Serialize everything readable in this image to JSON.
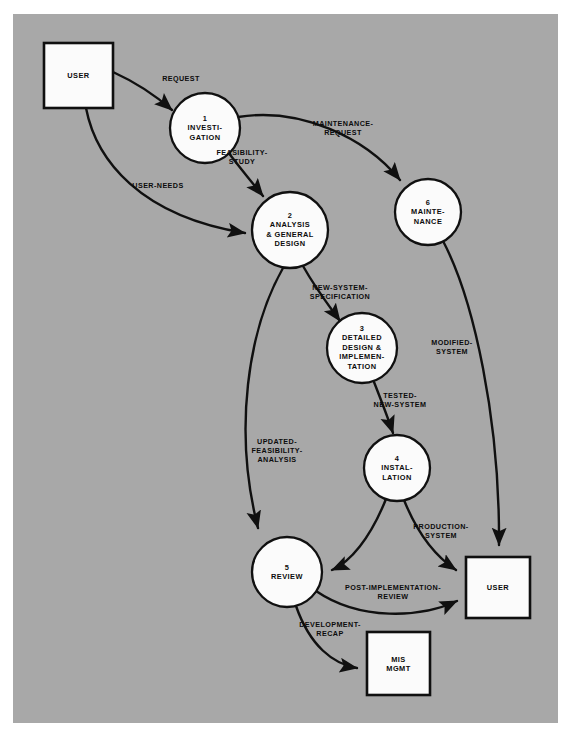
{
  "diagram": {
    "type": "data-flow-diagram",
    "background_color": "#a8a8a8",
    "page_color": "#ffffff",
    "line_color": "#101010",
    "node_fill": "#fbfbfb",
    "nodes": [
      {
        "id": "user-left",
        "shape": "box",
        "label": "USER",
        "x": 44,
        "y": 43,
        "w": 69,
        "h": 65
      },
      {
        "id": "process-1",
        "shape": "circle",
        "number": "1",
        "label": "1\nINVESTI-\nGATION",
        "cx": 205,
        "cy": 128,
        "r": 35
      },
      {
        "id": "process-2",
        "shape": "circle",
        "number": "2",
        "label": "2\nANALYSIS\n& GENERAL\nDESIGN",
        "cx": 290,
        "cy": 230,
        "r": 38
      },
      {
        "id": "process-6",
        "shape": "circle",
        "number": "6",
        "label": "6\nMAINTE-\nNANCE",
        "cx": 428,
        "cy": 212,
        "r": 33
      },
      {
        "id": "process-3",
        "shape": "circle",
        "number": "3",
        "label": "3\nDETAILED\nDESIGN &\nIMPLEMEN-\nTATION",
        "cx": 362,
        "cy": 348,
        "r": 35
      },
      {
        "id": "process-4",
        "shape": "circle",
        "number": "4",
        "label": "4\nINSTAL-\nLATION",
        "cx": 397,
        "cy": 468,
        "r": 33
      },
      {
        "id": "process-5",
        "shape": "circle",
        "number": "5",
        "label": "5\nREVIEW",
        "cx": 287,
        "cy": 572,
        "r": 35
      },
      {
        "id": "user-right",
        "shape": "box",
        "label": "USER",
        "x": 466,
        "y": 557,
        "w": 64,
        "h": 61
      },
      {
        "id": "mis-mgmt",
        "shape": "box",
        "label": "MIS\nMGMT",
        "x": 367,
        "y": 632,
        "w": 63,
        "h": 63
      }
    ],
    "flows": [
      {
        "id": "flow-request",
        "label": "REQUEST",
        "from": "user-left",
        "to": "process-1",
        "label_x": 181,
        "label_y": 79
      },
      {
        "id": "flow-user-needs",
        "label": "USER-NEEDS",
        "from": "user-left",
        "to": "process-2",
        "label_x": 158,
        "label_y": 186
      },
      {
        "id": "flow-feasibility-study",
        "label": "FEASIBILITY-\nSTUDY",
        "from": "process-1",
        "to": "process-2",
        "label_x": 242,
        "label_y": 157
      },
      {
        "id": "flow-maintenance-request",
        "label": "MAINTENANCE-\nREQUEST",
        "from": "process-1",
        "to": "process-6",
        "label_x": 343,
        "label_y": 128
      },
      {
        "id": "flow-new-system-specification",
        "label": "NEW-SYSTEM-\nSPECIFICATION",
        "from": "process-2",
        "to": "process-3",
        "label_x": 340,
        "label_y": 292
      },
      {
        "id": "flow-tested-new-system",
        "label": "TESTED-\nNEW-SYSTEM",
        "from": "process-3",
        "to": "process-4",
        "label_x": 400,
        "label_y": 400
      },
      {
        "id": "flow-modified-system",
        "label": "MODIFIED-\nSYSTEM",
        "from": "process-6",
        "to": "user-right",
        "label_x": 452,
        "label_y": 347
      },
      {
        "id": "flow-updated-feasibility-analysis",
        "label": "UPDATED-\nFEASIBILITY-\nANALYSIS",
        "from": "process-2",
        "to": "process-5",
        "label_x": 277,
        "label_y": 451
      },
      {
        "id": "flow-production-system",
        "label": "PRODUCTION-\nSYSTEM",
        "from": "process-4",
        "to": "user-right",
        "label_x": 441,
        "label_y": 531
      },
      {
        "id": "flow-installation-to-review",
        "label": "",
        "from": "process-4",
        "to": "process-5",
        "label_x": 0,
        "label_y": 0
      },
      {
        "id": "flow-post-implementation-review",
        "label": "POST-IMPLEMENTATION-\nREVIEW",
        "from": "process-5",
        "to": "user-right",
        "label_x": 393,
        "label_y": 592
      },
      {
        "id": "flow-development-recap",
        "label": "DEVELOPMENT-\nRECAP",
        "from": "process-5",
        "to": "mis-mgmt",
        "label_x": 330,
        "label_y": 629
      }
    ]
  }
}
